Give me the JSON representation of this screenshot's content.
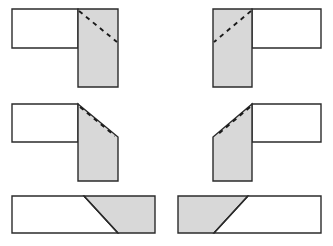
{
  "figure": {
    "background_color": "#ffffff",
    "outline_color": "#2b2b2b",
    "shaded_fill_color": "#d8d8d8",
    "unshaded_fill_color": "#ffffff",
    "dash_color": "#1a1a1a",
    "rows": 3,
    "columns": 2,
    "canvas": {
      "width": 333,
      "height": 246
    }
  },
  "panels": [
    {
      "id": "panel-top-left",
      "name": "butt-joint-vertical-member-right",
      "row": 1,
      "column": 1,
      "orientation": "left-horizontal-with-right-vertical",
      "shaded_member": "vertical",
      "dashed_line": "diagonal-from-inner-corner-downward-right",
      "shapes": [
        {
          "kind": "polygon",
          "fill": "unshaded",
          "points": "12,9 78,9 78,48 12,48"
        },
        {
          "kind": "polygon",
          "fill": "shaded",
          "points": "78,9 118,9 118,87 78,87"
        },
        {
          "kind": "dashed",
          "points": "79,11 117,42"
        }
      ]
    },
    {
      "id": "panel-top-right",
      "name": "butt-joint-vertical-member-left",
      "row": 1,
      "column": 2,
      "orientation": "right-horizontal-with-left-vertical",
      "shaded_member": "vertical",
      "dashed_line": "diagonal-from-inner-corner-downward-left",
      "shapes": [
        {
          "kind": "polygon",
          "fill": "unshaded",
          "points": "252,9 321,9 321,48 252,48"
        },
        {
          "kind": "polygon",
          "fill": "shaded",
          "points": "213,9 252,9 252,87 213,87"
        },
        {
          "kind": "dashed",
          "points": "251,11 214,42"
        }
      ]
    },
    {
      "id": "panel-middle-left",
      "name": "mitre-joint-vertical-member-right",
      "row": 2,
      "column": 1,
      "orientation": "left-horizontal-with-right-vertical",
      "shaded_member": "vertical-with-chamfered-top-right",
      "dashed_line": "diagonal-parallel-inside-chamfer",
      "shapes": [
        {
          "kind": "polygon",
          "fill": "unshaded",
          "points": "12,104 78,104 78,142 12,142"
        },
        {
          "kind": "polygon",
          "fill": "shaded",
          "points": "78,104 118,137 118,181 78,181"
        },
        {
          "kind": "dashed",
          "points": "80,107 115,136"
        }
      ]
    },
    {
      "id": "panel-middle-right",
      "name": "mitre-joint-vertical-member-left",
      "row": 2,
      "column": 2,
      "orientation": "right-horizontal-with-left-vertical",
      "shaded_member": "vertical-with-chamfered-top-left",
      "dashed_line": "diagonal-parallel-inside-chamfer",
      "shapes": [
        {
          "kind": "polygon",
          "fill": "unshaded",
          "points": "252,104 321,104 321,142 252,142"
        },
        {
          "kind": "polygon",
          "fill": "shaded",
          "points": "252,104 252,181 213,181 213,137"
        },
        {
          "kind": "dashed",
          "points": "250,107 216,136"
        }
      ]
    },
    {
      "id": "panel-bottom-left",
      "name": "scarf-joint-shaded-right",
      "row": 3,
      "column": 1,
      "orientation": "horizontal-bar",
      "shaded_member": "right-section",
      "dashed_line": "none",
      "shapes": [
        {
          "kind": "polygon",
          "fill": "unshaded",
          "points": "12,196 84,196 118,233 12,233"
        },
        {
          "kind": "polygon",
          "fill": "shaded",
          "points": "84,196 155,196 155,233 118,233"
        },
        {
          "kind": "divider",
          "points": "84,196 118,233"
        }
      ]
    },
    {
      "id": "panel-bottom-right",
      "name": "scarf-joint-shaded-left",
      "row": 3,
      "column": 2,
      "orientation": "horizontal-bar",
      "shaded_member": "left-section",
      "dashed_line": "none",
      "shapes": [
        {
          "kind": "polygon",
          "fill": "shaded",
          "points": "178,196 248,196 214,233 178,233"
        },
        {
          "kind": "polygon",
          "fill": "unshaded",
          "points": "248,196 321,196 321,233 214,233"
        },
        {
          "kind": "divider",
          "points": "248,196 214,233"
        }
      ]
    }
  ]
}
